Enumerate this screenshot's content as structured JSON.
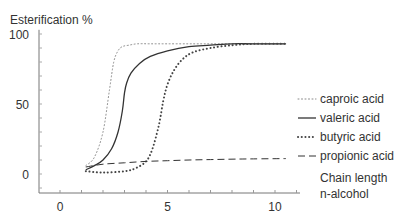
{
  "chart_data": {
    "type": "line",
    "title": "",
    "ylabel": "Esterification %",
    "xlabel": [
      "Chain length",
      "n-alcohol"
    ],
    "xlim": [
      -1,
      11.2
    ],
    "ylim": [
      -13,
      103
    ],
    "xticks": [
      0,
      5,
      10
    ],
    "xminor_step": 1,
    "yticks": [
      0,
      50,
      100
    ],
    "yminor_step": 10,
    "grid": false,
    "legend_position": "right",
    "series": [
      {
        "name": "caproic acid",
        "style": "fine-dotted",
        "x": [
          1.2,
          1.6,
          2.0,
          2.3,
          2.5,
          2.7,
          2.9,
          3.2,
          3.6,
          4.2,
          5,
          6,
          7,
          8,
          9,
          10.5
        ],
        "y": [
          6,
          12,
          30,
          60,
          80,
          88,
          91,
          92,
          93,
          93,
          93,
          93,
          93,
          93,
          93,
          93
        ]
      },
      {
        "name": "valeric acid",
        "style": "solid",
        "x": [
          1.2,
          1.6,
          2.0,
          2.4,
          2.7,
          2.9,
          3.0,
          3.1,
          3.3,
          3.7,
          4.2,
          5,
          6,
          7,
          8,
          9,
          10.5
        ],
        "y": [
          3,
          6,
          10,
          18,
          30,
          45,
          58,
          65,
          72,
          79,
          84,
          88,
          91,
          92,
          93,
          93,
          93
        ]
      },
      {
        "name": "butyric acid",
        "style": "heavy-dotted",
        "x": [
          1.2,
          2,
          3,
          3.5,
          4,
          4.3,
          4.6,
          4.8,
          5.0,
          5.3,
          5.7,
          6.2,
          7,
          8,
          9,
          10.5
        ],
        "y": [
          2,
          1,
          2,
          4,
          9,
          18,
          35,
          52,
          64,
          74,
          82,
          87,
          90,
          92,
          93,
          93
        ]
      },
      {
        "name": "propionic acid",
        "style": "dashed",
        "x": [
          1.2,
          2,
          3,
          4,
          5,
          6,
          7,
          8,
          9,
          10.5
        ],
        "y": [
          5,
          7,
          8,
          9,
          9.5,
          10,
          10.3,
          10.6,
          10.8,
          11
        ]
      }
    ]
  }
}
